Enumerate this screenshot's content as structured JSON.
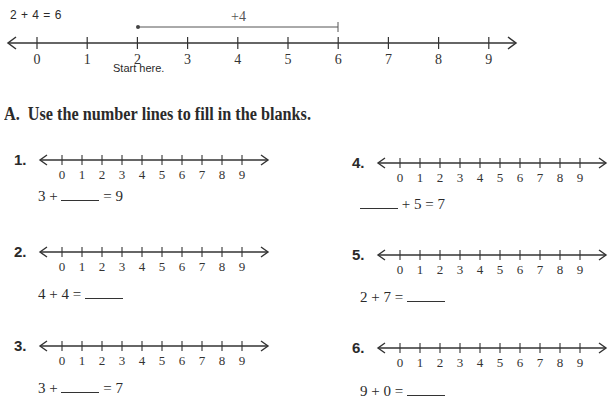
{
  "example": {
    "equation": "2 + 4 = 6",
    "jump_label": "+4",
    "start_label": "Start here.",
    "ticks": [
      "0",
      "1",
      "2",
      "3",
      "4",
      "5",
      "6",
      "7",
      "8",
      "9"
    ],
    "start_value": 2,
    "end_value": 6
  },
  "section": {
    "heading": "A.  Use the number lines to fill in the blanks."
  },
  "problems": [
    {
      "number": "1.",
      "parts": [
        "3 + ",
        "BLANK",
        " = 9"
      ]
    },
    {
      "number": "2.",
      "parts": [
        "4 + 4 = ",
        "BLANK",
        ""
      ]
    },
    {
      "number": "3.",
      "parts": [
        "3 + ",
        "BLANK",
        " = 7"
      ]
    },
    {
      "number": "4.",
      "parts": [
        "",
        "BLANK",
        " + 5 = 7"
      ]
    },
    {
      "number": "5.",
      "parts": [
        "2 + 7 = ",
        "BLANK",
        ""
      ]
    },
    {
      "number": "6.",
      "parts": [
        "9 + 0 = ",
        "BLANK",
        ""
      ]
    }
  ],
  "small_ticks": [
    "0",
    "1",
    "2",
    "3",
    "4",
    "5",
    "6",
    "7",
    "8",
    "9"
  ]
}
